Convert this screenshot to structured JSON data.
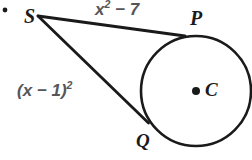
{
  "figure": {
    "kind": "geometry-diagram",
    "topic": "two-tangent-segments-to-a-circle",
    "background_color": "#ffffff",
    "stroke_color": "#1a1a1a",
    "expression_color": "#56565a"
  },
  "bullet": {
    "glyph": "•"
  },
  "points": {
    "S": {
      "label": "S",
      "x": 38,
      "y": 16
    },
    "P": {
      "label": "P",
      "x": 185,
      "y": 36
    },
    "Q": {
      "label": "Q",
      "x": 148,
      "y": 122
    },
    "C": {
      "label": "C",
      "x": 196,
      "y": 91
    }
  },
  "circle": {
    "center_x": 196,
    "center_y": 91,
    "radius": 55,
    "center_dot_radius": 4
  },
  "segments": [
    {
      "name": "SP",
      "from": "S",
      "to": "P",
      "label": "x² − 7"
    },
    {
      "name": "SQ",
      "from": "S",
      "to": "Q",
      "label": "(x − 1)²"
    }
  ],
  "labels": {
    "top_expression": {
      "base": "x",
      "exponent": "2",
      "tail": " − 7"
    },
    "left_expression": {
      "base": "(x − 1)",
      "exponent": "2",
      "tail": ""
    }
  }
}
